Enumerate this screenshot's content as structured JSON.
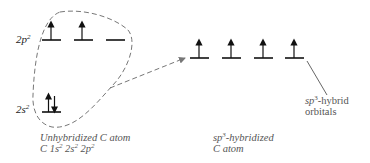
{
  "diagram": {
    "unhybridized": {
      "levels": [
        {
          "label_base": "2p",
          "label_sup": "2",
          "orbitals": [
            "up",
            "up",
            "empty"
          ]
        },
        {
          "label_base": "2s",
          "label_sup": "2",
          "orbitals": [
            "up-down"
          ]
        }
      ],
      "caption_line1": "Unhybridized C atom",
      "caption_line2_parts": [
        "C 1s",
        "2",
        " 2s",
        "2",
        " 2p",
        "2"
      ]
    },
    "hybridized": {
      "orbitals": [
        "up",
        "up",
        "up",
        "up"
      ],
      "caption_line1_base": "sp",
      "caption_line1_sup": "3",
      "caption_line1_rest": "-hybridized",
      "caption_line2": "C atom"
    },
    "annotation": {
      "base": "sp",
      "sup": "3",
      "rest": "-hybrid",
      "line2": "orbitals"
    },
    "colors": {
      "stroke": "#111111",
      "dashed": "#777777",
      "text": "#555555"
    }
  }
}
